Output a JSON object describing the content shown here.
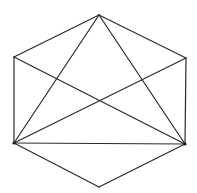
{
  "diagram": {
    "type": "geometric-figure",
    "background": "#ffffff",
    "stroke_color": "#2a2a2a",
    "vertices": {
      "top": {
        "x": 99,
        "y": 15
      },
      "upper_left": {
        "x": 14,
        "y": 57
      },
      "upper_right": {
        "x": 186,
        "y": 58
      },
      "lower_left": {
        "x": 14,
        "y": 143
      },
      "lower_right": {
        "x": 185,
        "y": 144
      },
      "bottom": {
        "x": 99,
        "y": 187
      }
    },
    "edges": [
      {
        "from": "top",
        "to": "upper_left"
      },
      {
        "from": "top",
        "to": "upper_right"
      },
      {
        "from": "upper_left",
        "to": "lower_left"
      },
      {
        "from": "upper_right",
        "to": "lower_right"
      },
      {
        "from": "lower_left",
        "to": "bottom"
      },
      {
        "from": "lower_right",
        "to": "bottom"
      },
      {
        "from": "top",
        "to": "lower_left"
      },
      {
        "from": "top",
        "to": "lower_right"
      },
      {
        "from": "upper_left",
        "to": "lower_right"
      },
      {
        "from": "upper_right",
        "to": "lower_left"
      },
      {
        "from": "lower_left",
        "to": "lower_right"
      }
    ],
    "marked_vertices": [
      "lower_left",
      "lower_right"
    ]
  }
}
